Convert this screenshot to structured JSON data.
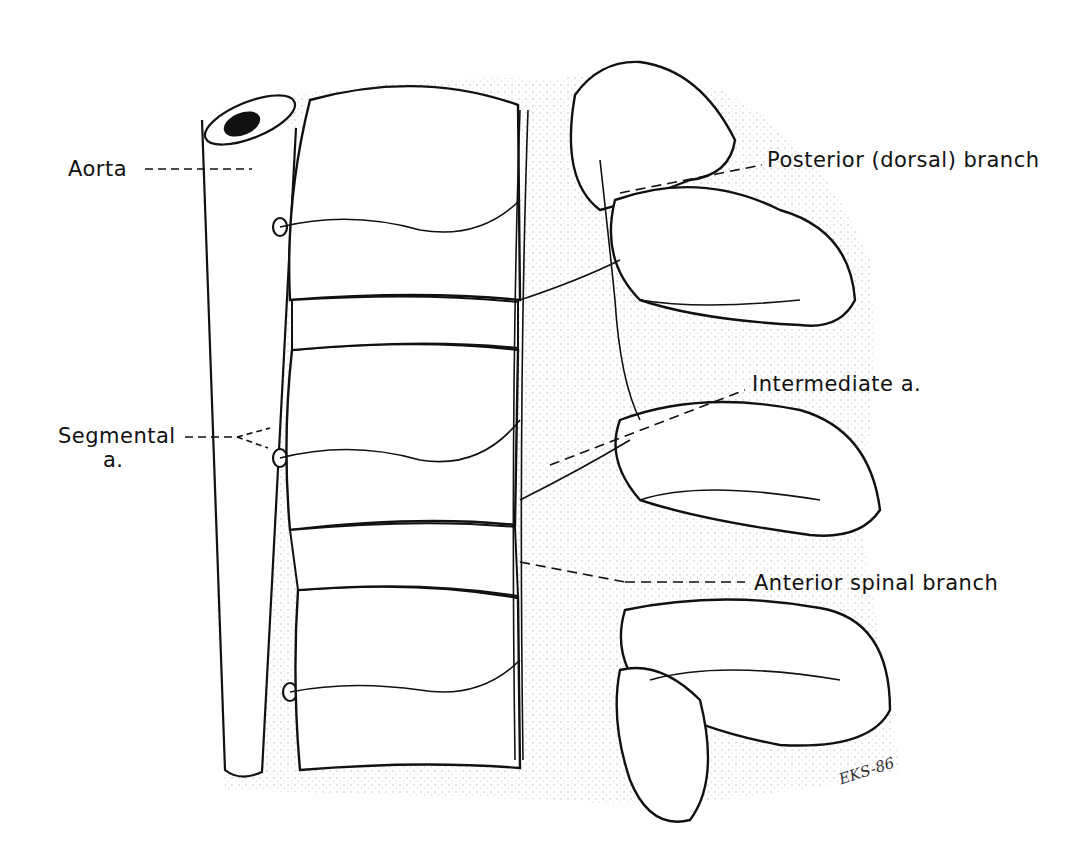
{
  "figure": {
    "labels": {
      "aorta": "Aorta",
      "posterior_branch": "Posterior (dorsal) branch",
      "segmental_line1": "Segmental",
      "segmental_line2": "a.",
      "intermediate": "Intermediate a.",
      "anterior_spinal": "Anterior spinal branch"
    },
    "signature": "EKS-86",
    "colors": {
      "ink": "#111111",
      "background": "#ffffff",
      "stipple": "#888888"
    }
  }
}
